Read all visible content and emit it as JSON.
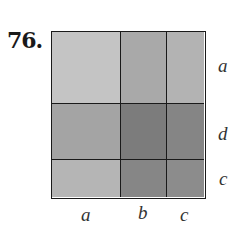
{
  "problem": {
    "number": "76."
  },
  "diagram": {
    "columns": [
      {
        "label": "a",
        "width": 69
      },
      {
        "label": "b",
        "width": 46
      },
      {
        "label": "c",
        "width": 40
      }
    ],
    "rows": [
      {
        "label": "a",
        "height": 72
      },
      {
        "label": "d",
        "height": 56
      },
      {
        "label": "c",
        "height": 40
      }
    ],
    "cell_colors": [
      [
        "#c4c4c4",
        "#a9a9a9",
        "#b3b3b3"
      ],
      [
        "#a4a4a4",
        "#7c7c7c",
        "#858585"
      ],
      [
        "#b5b5b5",
        "#868686",
        "#8c8c8c"
      ]
    ]
  }
}
